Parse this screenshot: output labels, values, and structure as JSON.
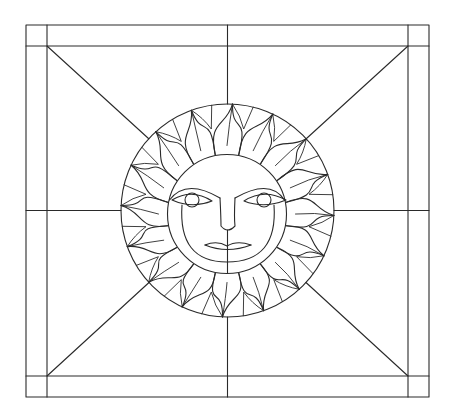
{
  "title": "Sun face stained glass pattern",
  "colors": {
    "line": "#2a2a2a",
    "background": "#ffffff"
  },
  "frame": {
    "outer": {
      "x1": 26,
      "y1": 25,
      "x2": 429,
      "y2": 397
    },
    "inner": {
      "x1": 47,
      "y1": 46,
      "x2": 408,
      "y2": 376
    }
  },
  "center": {
    "x": 227.5,
    "y": 210.5
  },
  "outer_circle_r": 106.5,
  "face_circle": {
    "cx": 227,
    "cy": 214,
    "r": 59.5
  },
  "rays": {
    "count": 16,
    "rotation_deg": 0
  },
  "face": {
    "left_eye": {
      "cx": 192,
      "cy": 200,
      "iris_r": 7
    },
    "right_eye": {
      "cx": 264,
      "cy": 200,
      "iris_r": 7
    },
    "nose": {
      "top_y": 198,
      "bottom_y": 230,
      "left_x": 220,
      "right_x": 235
    },
    "mouth_y": 245
  }
}
